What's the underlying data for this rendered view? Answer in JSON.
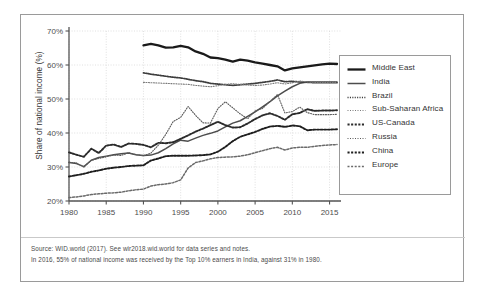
{
  "chart_data": {
    "type": "line",
    "title": "",
    "xlabel": "",
    "ylabel": "Share of national income (%)",
    "xlim": [
      1980,
      2016
    ],
    "ylim": [
      20,
      70
    ],
    "yticks": [
      "20%",
      "30%",
      "40%",
      "50%",
      "60%",
      "70%"
    ],
    "ytick_values": [
      20,
      30,
      40,
      50,
      60,
      70
    ],
    "xticks": [
      "1980",
      "1985",
      "1990",
      "1995",
      "2000",
      "2005",
      "2010",
      "2015"
    ],
    "xtick_values": [
      1980,
      1985,
      1990,
      1995,
      2000,
      2005,
      2010,
      2015
    ],
    "grid": true,
    "legend_position": "right",
    "series": [
      {
        "name": "Middle East",
        "style": "solid-thick",
        "color": "#1a1a1a",
        "x": [
          1990,
          1991,
          1992,
          1993,
          1994,
          1995,
          1996,
          1997,
          1998,
          1999,
          2000,
          2001,
          2002,
          2003,
          2004,
          2005,
          2006,
          2007,
          2008,
          2009,
          2010,
          2011,
          2012,
          2013,
          2014,
          2015,
          2016
        ],
        "values": [
          65.8,
          66.2,
          65.8,
          65.1,
          65.2,
          65.6,
          65.2,
          64.0,
          63.3,
          62.2,
          62.0,
          61.6,
          61.0,
          61.6,
          61.3,
          60.8,
          60.4,
          60.0,
          59.6,
          58.4,
          59.0,
          59.3,
          59.6,
          59.9,
          60.2,
          60.4,
          60.3
        ]
      },
      {
        "name": "India",
        "style": "solid-medium",
        "color": "#4d4d4d",
        "x": [
          1980,
          1981,
          1982,
          1983,
          1984,
          1985,
          1986,
          1987,
          1988,
          1989,
          1990,
          1991,
          1992,
          1993,
          1994,
          1995,
          1996,
          1997,
          1998,
          1999,
          2000,
          2001,
          2002,
          2003,
          2004,
          2005,
          2006,
          2007,
          2008,
          2009,
          2010,
          2011,
          2012,
          2013,
          2014,
          2015,
          2016
        ],
        "values": [
          31.3,
          31.0,
          30.1,
          32.0,
          32.8,
          33.2,
          33.6,
          33.9,
          34.1,
          33.6,
          33.4,
          33.5,
          34.2,
          35.4,
          36.8,
          37.9,
          37.6,
          38.5,
          39.3,
          39.9,
          40.6,
          41.8,
          42.9,
          43.6,
          44.9,
          46.2,
          47.7,
          49.2,
          50.9,
          52.3,
          53.6,
          54.6,
          55.0,
          55.0,
          55.0,
          55.0,
          55.0
        ]
      },
      {
        "name": "Brazil",
        "style": "dotted-bold",
        "color": "#3d3d3d",
        "x": [
          1990,
          1991,
          1992,
          1993,
          1994,
          1995,
          1996,
          1997,
          1998,
          1999,
          2000,
          2001,
          2002,
          2003,
          2004,
          2005,
          2006,
          2007,
          2008,
          2009,
          2010,
          2011,
          2012,
          2013,
          2014,
          2015,
          2016
        ],
        "values": [
          57.7,
          57.3,
          57.0,
          56.7,
          56.4,
          56.2,
          55.8,
          55.4,
          55.1,
          54.6,
          54.4,
          54.2,
          54.0,
          54.2,
          54.4,
          54.6,
          54.9,
          55.2,
          55.6,
          55.1,
          55.2,
          55.0,
          54.9,
          54.8,
          54.8,
          54.8,
          54.8
        ]
      },
      {
        "name": "Sub-Saharan Africa",
        "style": "dotted-fine",
        "color": "#7a7a7a",
        "x": [
          1990,
          1991,
          1992,
          1993,
          1994,
          1995,
          1996,
          1997,
          1998,
          1999,
          2000,
          2001,
          2002,
          2003,
          2004,
          2005,
          2006,
          2007,
          2008,
          2009,
          2010,
          2011,
          2012,
          2013,
          2014,
          2015,
          2016
        ],
        "values": [
          54.9,
          54.8,
          54.7,
          54.6,
          54.5,
          54.4,
          54.3,
          54.0,
          53.8,
          53.6,
          53.9,
          54.3,
          54.5,
          54.3,
          54.1,
          54.0,
          54.1,
          54.4,
          54.8,
          54.4,
          54.8,
          55.3,
          55.0,
          54.9,
          54.9,
          54.9,
          54.9
        ]
      },
      {
        "name": "US-Canada",
        "style": "dashed-bold",
        "color": "#2b2b2b",
        "x": [
          1980,
          1981,
          1982,
          1983,
          1984,
          1985,
          1986,
          1987,
          1988,
          1989,
          1990,
          1991,
          1992,
          1993,
          1994,
          1995,
          1996,
          1997,
          1998,
          1999,
          2000,
          2001,
          2002,
          2003,
          2004,
          2005,
          2006,
          2007,
          2008,
          2009,
          2010,
          2011,
          2012,
          2013,
          2014,
          2015,
          2016
        ],
        "values": [
          34.3,
          33.6,
          33.0,
          35.4,
          34.1,
          36.3,
          36.6,
          35.9,
          36.9,
          36.8,
          36.5,
          35.8,
          37.1,
          37.0,
          37.3,
          38.3,
          39.3,
          40.4,
          41.3,
          42.3,
          43.3,
          42.3,
          41.6,
          41.7,
          42.8,
          44.1,
          45.2,
          45.8,
          45.0,
          43.9,
          45.5,
          45.9,
          47.0,
          46.5,
          46.6,
          46.6,
          46.7
        ]
      },
      {
        "name": "Russia",
        "style": "dotted-fine",
        "color": "#5a5a5a",
        "x": [
          1980,
          1981,
          1982,
          1983,
          1984,
          1985,
          1986,
          1987,
          1988,
          1989,
          1990,
          1991,
          1992,
          1993,
          1994,
          1995,
          1996,
          1997,
          1998,
          1999,
          2000,
          2001,
          2002,
          2003,
          2004,
          2005,
          2006,
          2007,
          2008,
          2009,
          2010,
          2011,
          2012,
          2013,
          2014,
          2015,
          2016
        ],
        "values": [
          31.4,
          31.2,
          30.0,
          32.0,
          32.5,
          33.0,
          33.5,
          33.4,
          34.2,
          33.6,
          33.3,
          34.1,
          36.4,
          39.6,
          43.4,
          44.6,
          47.8,
          45.2,
          43.0,
          42.9,
          47.2,
          49.2,
          47.4,
          45.6,
          44.2,
          46.5,
          47.2,
          49.3,
          51.3,
          45.9,
          46.3,
          47.6,
          46.0,
          45.4,
          45.4,
          45.4,
          45.5
        ]
      },
      {
        "name": "China",
        "style": "dashed-bold",
        "color": "#1f1f1f",
        "x": [
          1980,
          1981,
          1982,
          1983,
          1984,
          1985,
          1986,
          1987,
          1988,
          1989,
          1990,
          1991,
          1992,
          1993,
          1994,
          1995,
          1996,
          1997,
          1998,
          1999,
          2000,
          2001,
          2002,
          2003,
          2004,
          2005,
          2006,
          2007,
          2008,
          2009,
          2010,
          2011,
          2012,
          2013,
          2014,
          2015,
          2016
        ],
        "values": [
          27.2,
          27.6,
          28.0,
          28.6,
          29.0,
          29.5,
          29.8,
          30.0,
          30.3,
          30.4,
          30.5,
          31.9,
          32.5,
          33.2,
          33.3,
          33.3,
          33.3,
          33.4,
          33.5,
          33.7,
          34.5,
          35.9,
          37.6,
          38.9,
          39.6,
          40.3,
          41.2,
          41.9,
          42.1,
          41.8,
          42.2,
          42.0,
          40.8,
          41.0,
          41.0,
          41.0,
          41.1
        ]
      },
      {
        "name": "Europe",
        "style": "dashed-medium",
        "color": "#6a6a6a",
        "x": [
          1980,
          1981,
          1982,
          1983,
          1984,
          1985,
          1986,
          1987,
          1988,
          1989,
          1990,
          1991,
          1992,
          1993,
          1994,
          1995,
          1996,
          1997,
          1998,
          1999,
          2000,
          2001,
          2002,
          2003,
          2004,
          2005,
          2006,
          2007,
          2008,
          2009,
          2010,
          2011,
          2012,
          2013,
          2014,
          2015,
          2016
        ],
        "values": [
          21.0,
          21.2,
          21.5,
          21.9,
          22.1,
          22.3,
          22.4,
          22.6,
          23.0,
          23.3,
          23.5,
          24.4,
          24.8,
          25.0,
          25.4,
          26.2,
          29.7,
          31.3,
          31.8,
          32.4,
          32.8,
          32.9,
          33.0,
          33.2,
          33.6,
          34.2,
          34.8,
          35.4,
          35.8,
          35.0,
          35.6,
          35.8,
          35.8,
          36.1,
          36.3,
          36.5,
          36.6
        ]
      }
    ]
  },
  "legend": {
    "items": [
      {
        "label": "Middle East",
        "swatch": "solid-thick"
      },
      {
        "label": "India",
        "swatch": "solid-medium"
      },
      {
        "label": "Brazil",
        "swatch": "dotted-bold"
      },
      {
        "label": "Sub-Saharan Africa",
        "swatch": "dotted-fine"
      },
      {
        "label": "US-Canada",
        "swatch": "dashed-bold"
      },
      {
        "label": "Russia",
        "swatch": "dotted-fine"
      },
      {
        "label": "China",
        "swatch": "dashed-bold"
      },
      {
        "label": "Europe",
        "swatch": "dashed-medium"
      }
    ]
  },
  "notes": {
    "source": "Source: WID.world (2017). See wir2018.wid.world for data series and notes.",
    "footnote": "In 2016, 55% of national income was received by the Top 10% earners in India, against 31% in 1980."
  },
  "colors": {
    "frame": "#9a9a9a",
    "axis": "#555555",
    "grid": "#d8d8d8",
    "text": "#333333"
  }
}
